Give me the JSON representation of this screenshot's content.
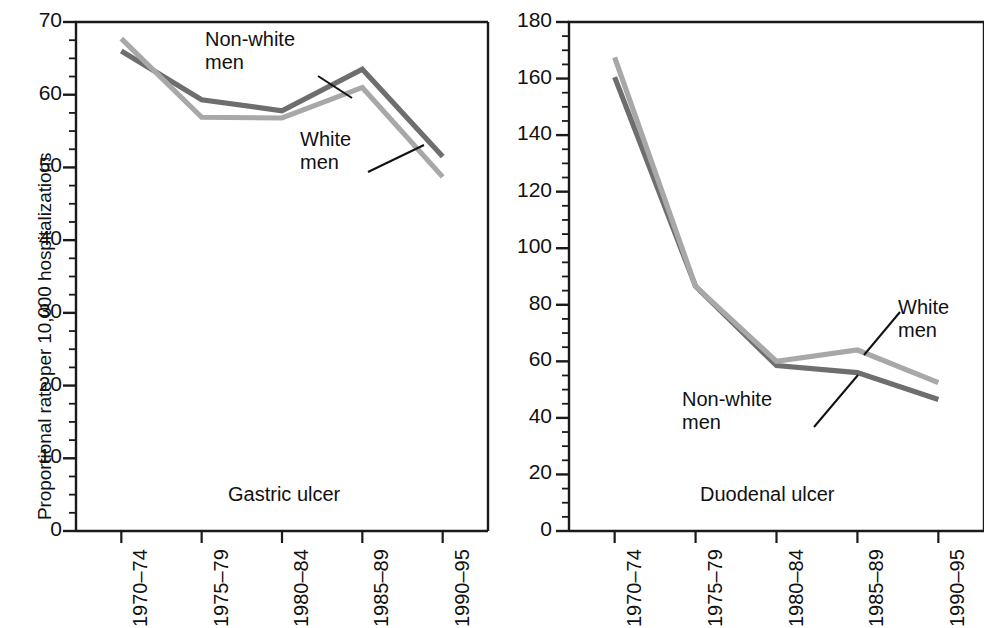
{
  "figure": {
    "width": 984,
    "height": 628,
    "background": "#ffffff"
  },
  "colors": {
    "nonwhite_men": "#6e6e6e",
    "white_men": "#a8a8a8",
    "axis": "#1a1a1a",
    "text": "#111111"
  },
  "panels": [
    {
      "id": "gastric",
      "caption": "Gastric ulcer",
      "ylabel": "Proportional rate per 10,000 hospitalizations",
      "annotations": [
        {
          "name": "non-white-men",
          "line1": "Non-white",
          "line2": "men"
        },
        {
          "name": "white-men",
          "line1": "White",
          "line2": "men"
        }
      ],
      "yticks": [
        "0",
        "10",
        "20",
        "30",
        "40",
        "50",
        "60",
        "70"
      ],
      "xticks": [
        "1970–74",
        "1975–79",
        "1980–84",
        "1985–89",
        "1990–95"
      ]
    },
    {
      "id": "duodenal",
      "caption": "Duodenal ulcer",
      "ylabel": "",
      "annotations": [
        {
          "name": "white-men",
          "line1": "White",
          "line2": "men"
        },
        {
          "name": "non-white-men",
          "line1": "Non-white",
          "line2": "men"
        }
      ],
      "yticks": [
        "0",
        "20",
        "40",
        "60",
        "80",
        "100",
        "120",
        "140",
        "160",
        "180"
      ],
      "xticks": [
        "1970–74",
        "1975–79",
        "1980–84",
        "1985–89",
        "1990–95"
      ]
    }
  ],
  "chart_data": [
    {
      "type": "line",
      "title": "Gastric ulcer",
      "xlabel": "",
      "ylabel": "Proportional rate per 10,000 hospitalizations",
      "categories": [
        "1970–74",
        "1975–79",
        "1980–84",
        "1985–89",
        "1990–95"
      ],
      "ylim": [
        0,
        70
      ],
      "ytick_step": 10,
      "yminor_step": 2.5,
      "grid": false,
      "legend": "inline-annotations",
      "series": [
        {
          "name": "Non-white men",
          "color": "#6e6e6e",
          "values": [
            66.0,
            59.3,
            57.8,
            63.5,
            51.5
          ]
        },
        {
          "name": "White men",
          "color": "#a8a8a8",
          "values": [
            67.7,
            56.9,
            56.8,
            61.0,
            48.7
          ]
        }
      ]
    },
    {
      "type": "line",
      "title": "Duodenal ulcer",
      "xlabel": "",
      "ylabel": "",
      "categories": [
        "1970–74",
        "1975–79",
        "1980–84",
        "1985–89",
        "1990–95"
      ],
      "ylim": [
        0,
        180
      ],
      "ytick_step": 20,
      "yminor_step": 5,
      "grid": false,
      "legend": "inline-annotations",
      "series": [
        {
          "name": "Non-white men",
          "color": "#6e6e6e",
          "values": [
            160.5,
            86.5,
            58.5,
            56.0,
            46.5
          ]
        },
        {
          "name": "White men",
          "color": "#a8a8a8",
          "values": [
            167.5,
            86.5,
            60.0,
            64.0,
            52.5
          ]
        }
      ]
    }
  ]
}
